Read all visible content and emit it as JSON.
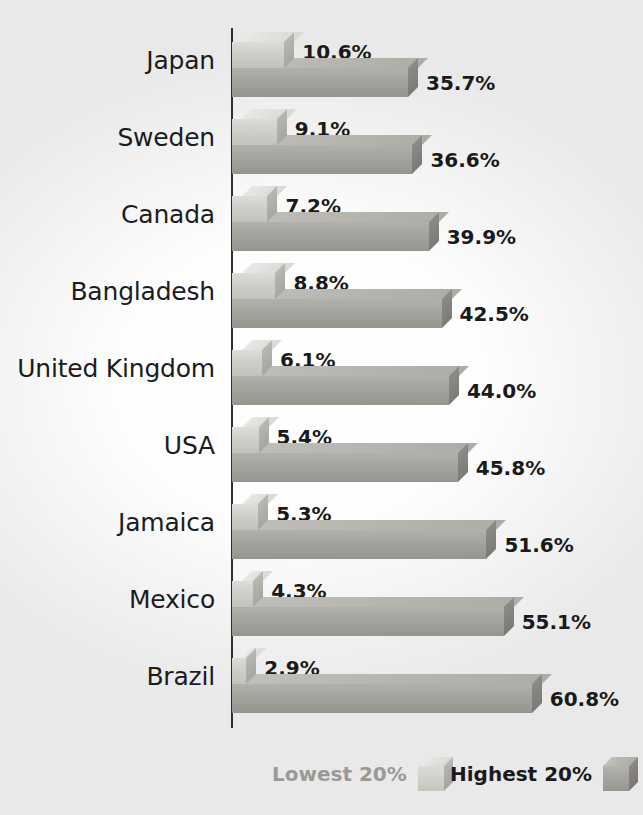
{
  "chart_data": {
    "type": "bar",
    "orientation": "horizontal",
    "title": "",
    "subtitle": "",
    "xlabel": "",
    "ylabel": "",
    "grid": false,
    "xlim": [
      0,
      60.8
    ],
    "legend_position": "bottom-right",
    "categories": [
      "Japan",
      "Sweden",
      "Canada",
      "Bangladesh",
      "United Kingdom",
      "USA",
      "Jamaica",
      "Mexico",
      "Brazil"
    ],
    "series": [
      {
        "name": "Lowest 20%",
        "color": "#d2d0cb",
        "values": [
          10.6,
          9.1,
          7.2,
          8.8,
          6.1,
          5.4,
          5.3,
          4.3,
          2.9
        ],
        "labels": [
          "10.6%",
          "9.1%",
          "7.2%",
          "8.8%",
          "6.1%",
          "5.4%",
          "5.3%",
          "4.3%",
          "2.9%"
        ]
      },
      {
        "name": "Highest 20%",
        "color": "#a5a39e",
        "values": [
          35.7,
          36.6,
          39.9,
          42.5,
          44.0,
          45.8,
          51.6,
          55.1,
          60.8
        ],
        "labels": [
          "35.7%",
          "36.6%",
          "39.9%",
          "42.5%",
          "44.0%",
          "45.8%",
          "51.6%",
          "55.1%",
          "60.8%"
        ]
      }
    ]
  },
  "rows": [
    {
      "country": "Japan",
      "low_label": "10.6%",
      "high_label": "35.7%",
      "low": 10.6,
      "high": 35.7
    },
    {
      "country": "Sweden",
      "low_label": "9.1%",
      "high_label": "36.6%",
      "low": 9.1,
      "high": 36.6
    },
    {
      "country": "Canada",
      "low_label": "7.2%",
      "high_label": "39.9%",
      "low": 7.2,
      "high": 39.9
    },
    {
      "country": "Bangladesh",
      "low_label": "8.8%",
      "high_label": "42.5%",
      "low": 8.8,
      "high": 42.5
    },
    {
      "country": "United Kingdom",
      "low_label": "6.1%",
      "high_label": "44.0%",
      "low": 6.1,
      "high": 44.0
    },
    {
      "country": "USA",
      "low_label": "5.4%",
      "high_label": "45.8%",
      "low": 5.4,
      "high": 45.8
    },
    {
      "country": "Jamaica",
      "low_label": "5.3%",
      "high_label": "51.6%",
      "low": 5.3,
      "high": 51.6
    },
    {
      "country": "Mexico",
      "low_label": "4.3%",
      "high_label": "55.1%",
      "low": 4.3,
      "high": 55.1
    },
    {
      "country": "Brazil",
      "low_label": "2.9%",
      "high_label": "60.8%",
      "low": 2.9,
      "high": 60.8
    }
  ],
  "legend": {
    "lowest": {
      "label": "Lowest 20%",
      "swatch": "cube-icon",
      "color": "#d2d0cb"
    },
    "highest": {
      "label": "Highest 20%",
      "swatch": "cube-icon",
      "color": "#a5a39e"
    }
  },
  "colors": {
    "lowest_bar": "#d2d0cb",
    "highest_bar": "#a5a39e",
    "axis": "#2e2e2e",
    "label_text": "#1c1c1c",
    "value_text": "#1a1a1a",
    "legend_low_text": "#9b9995",
    "legend_high_text": "#1a1a1a",
    "background": "#ffffff"
  }
}
